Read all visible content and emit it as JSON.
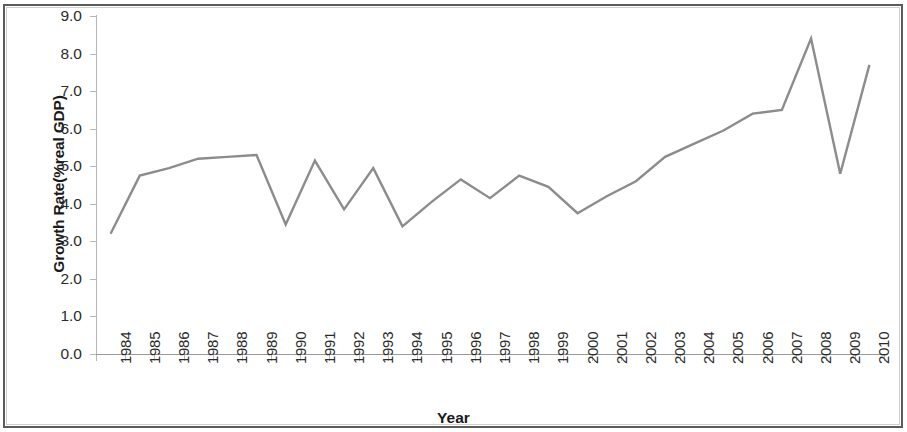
{
  "chart_data": {
    "type": "line",
    "title": "",
    "xlabel": "Year",
    "ylabel": "Growth Rate(%real GDP)",
    "ylim": [
      0.0,
      9.0
    ],
    "ytick_labels": [
      "9.0",
      "8.0",
      "7.0",
      "6.0",
      "5.0",
      "4.0",
      "3.0",
      "2.0",
      "1.0",
      "0.0"
    ],
    "ytick_values": [
      9.0,
      8.0,
      7.0,
      6.0,
      5.0,
      4.0,
      3.0,
      2.0,
      1.0,
      0.0
    ],
    "grid": false,
    "legend": false,
    "line_color": "#8c8c8c",
    "categories": [
      "1984",
      "1985",
      "1986",
      "1987",
      "1988",
      "1989",
      "1990",
      "1991",
      "1992",
      "1993",
      "1994",
      "1995",
      "1996",
      "1997",
      "1998",
      "1999",
      "2000",
      "2001",
      "2002",
      "2003",
      "2004",
      "2005",
      "2006",
      "2007",
      "2008",
      "2009",
      "2010"
    ],
    "values": [
      3.2,
      4.75,
      4.95,
      5.2,
      5.25,
      5.3,
      3.45,
      5.15,
      3.85,
      4.95,
      3.4,
      4.05,
      4.65,
      4.15,
      4.75,
      4.45,
      3.75,
      4.2,
      4.6,
      5.25,
      5.6,
      5.95,
      6.4,
      6.5,
      8.4,
      4.8,
      7.7
    ],
    "series": [
      {
        "name": "Growth Rate (% real GDP)",
        "values": [
          3.2,
          4.75,
          4.95,
          5.2,
          5.25,
          5.3,
          3.45,
          5.15,
          3.85,
          4.95,
          3.4,
          4.05,
          4.65,
          4.15,
          4.75,
          4.45,
          3.75,
          4.2,
          4.6,
          5.25,
          5.6,
          5.95,
          6.4,
          6.5,
          8.4,
          4.8,
          7.7
        ]
      }
    ]
  }
}
